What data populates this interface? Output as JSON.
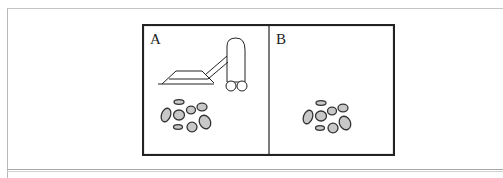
{
  "figure": {
    "panels": [
      {
        "label": "A",
        "contents": [
          "vacuum-cleaner",
          "dirt-pile"
        ]
      },
      {
        "label": "B",
        "contents": [
          "dirt-pile"
        ]
      }
    ],
    "colors": {
      "border": "#222222",
      "dirt_fill": "#c8c8c8",
      "dirt_stroke": "#333333"
    }
  }
}
